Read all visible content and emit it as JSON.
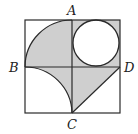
{
  "diagram": {
    "type": "geometry",
    "labels": {
      "A": "A",
      "B": "B",
      "C": "C",
      "D": "D"
    },
    "colors": {
      "stroke": "#2a2a2a",
      "shade": "#cfcfcf",
      "background": "#ffffff",
      "circle_fill": "#ffffff"
    }
  }
}
